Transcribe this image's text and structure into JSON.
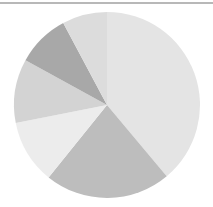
{
  "chart_data": {
    "type": "pie",
    "title": "",
    "categories": [
      "Slice 1",
      "Slice 2",
      "Slice 3",
      "Slice 4",
      "Slice 5",
      "Slice 6"
    ],
    "values": [
      38.9,
      21.9,
      11.1,
      11.1,
      9.2,
      7.8
    ],
    "colors": [
      "#e4e4e4",
      "#bdbdbd",
      "#ececec",
      "#d3d3d3",
      "#a8a8a8",
      "#dcdcdc"
    ],
    "start_angle": 0,
    "direction": "clockwise",
    "legend": "none",
    "labels_visible": false
  }
}
